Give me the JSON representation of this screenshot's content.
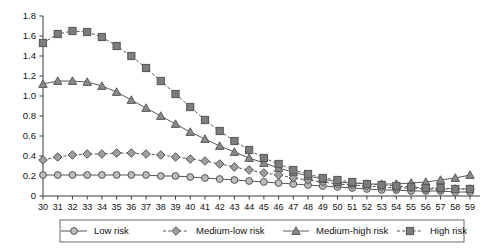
{
  "chart_data": {
    "type": "line",
    "title": "",
    "subtitle": "",
    "xlabel": "",
    "ylabel": "",
    "xlim": [
      30,
      59
    ],
    "ylim": [
      0,
      1.8
    ],
    "ytick_step": 0.2,
    "grid": false,
    "legend_position": "bottom",
    "yticks": [
      "0",
      "0.2",
      "0.4",
      "0.6",
      "0.8",
      "1.0",
      "1.2",
      "1.4",
      "1.6",
      "1.8"
    ],
    "categories": [
      30,
      31,
      32,
      33,
      34,
      35,
      36,
      37,
      38,
      39,
      40,
      41,
      42,
      43,
      44,
      45,
      46,
      47,
      48,
      49,
      50,
      51,
      52,
      53,
      54,
      55,
      56,
      57,
      58,
      59
    ],
    "series": [
      {
        "name": "Low risk",
        "marker": "circle",
        "linestyle": "solid",
        "color": "#555555",
        "marker_fill": "#bdbdbd",
        "values": [
          0.21,
          0.21,
          0.21,
          0.21,
          0.21,
          0.21,
          0.21,
          0.21,
          0.2,
          0.2,
          0.19,
          0.18,
          0.17,
          0.16,
          0.15,
          0.14,
          0.13,
          0.12,
          0.11,
          0.1,
          0.09,
          0.08,
          0.07,
          0.06,
          0.06,
          0.05,
          0.05,
          0.05,
          0.04,
          0.04
        ]
      },
      {
        "name": "Medium-low risk",
        "marker": "diamond",
        "linestyle": "dashed",
        "color": "#555555",
        "marker_fill": "#9e9e9e",
        "values": [
          0.36,
          0.39,
          0.41,
          0.42,
          0.42,
          0.43,
          0.43,
          0.42,
          0.41,
          0.39,
          0.37,
          0.35,
          0.32,
          0.29,
          0.26,
          0.23,
          0.21,
          0.18,
          0.16,
          0.14,
          0.12,
          0.11,
          0.1,
          0.09,
          0.08,
          0.08,
          0.07,
          0.07,
          0.07,
          0.07
        ]
      },
      {
        "name": "Medium-high risk",
        "marker": "triangle",
        "linestyle": "solid",
        "color": "#5a5a5a",
        "marker_fill": "#8a8a8a",
        "values": [
          1.12,
          1.15,
          1.15,
          1.14,
          1.1,
          1.04,
          0.96,
          0.88,
          0.8,
          0.72,
          0.64,
          0.57,
          0.5,
          0.44,
          0.38,
          0.33,
          0.28,
          0.24,
          0.2,
          0.17,
          0.14,
          0.13,
          0.12,
          0.12,
          0.12,
          0.13,
          0.14,
          0.16,
          0.18,
          0.21
        ]
      },
      {
        "name": "High risk",
        "marker": "square",
        "linestyle": "dashed",
        "color": "#555555",
        "marker_fill": "#7d7d7d",
        "values": [
          1.53,
          1.62,
          1.65,
          1.64,
          1.59,
          1.5,
          1.4,
          1.28,
          1.15,
          1.02,
          0.89,
          0.76,
          0.65,
          0.55,
          0.46,
          0.38,
          0.32,
          0.26,
          0.22,
          0.18,
          0.16,
          0.14,
          0.12,
          0.11,
          0.1,
          0.09,
          0.08,
          0.08,
          0.07,
          0.07
        ]
      }
    ]
  }
}
